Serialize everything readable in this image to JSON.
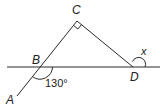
{
  "points": {
    "A": {
      "label": "A"
    },
    "B": {
      "label": "B"
    },
    "C": {
      "label": "C"
    },
    "D": {
      "label": "D"
    }
  },
  "angles": {
    "at_B": "130°",
    "at_D": "x",
    "at_C": "right-angle"
  },
  "colors": {
    "stroke": "#2a2a2a",
    "background": "#ffffff"
  }
}
